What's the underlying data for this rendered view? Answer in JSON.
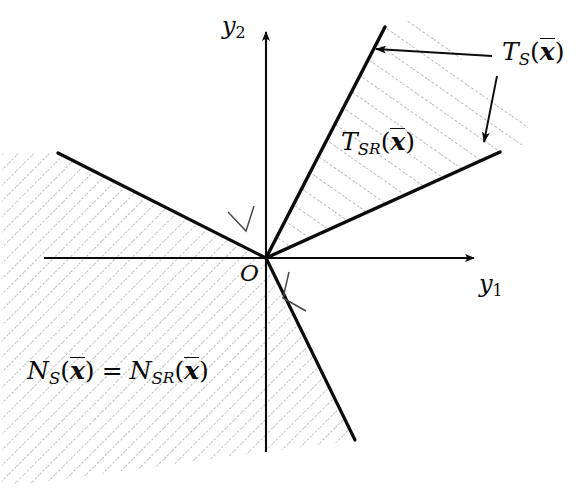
{
  "figure": {
    "background_color": "#ffffff",
    "ink_color": "#0b0b0b",
    "hatch_color": "#8a8a8a",
    "width": 580,
    "height": 489
  },
  "axes": {
    "origin_label": "O",
    "x_axis_label_base": "y",
    "x_axis_label_sub": "1",
    "y_axis_label_base": "y",
    "y_axis_label_sub": "2",
    "origin_px": [
      266,
      258
    ],
    "x_axis_tip_px": [
      478,
      258
    ],
    "y_axis_tip_px": [
      266,
      28
    ]
  },
  "labels": {
    "tangent_cone_S": {
      "base": "T",
      "subscript": "S",
      "argument": "x"
    },
    "tangent_cone_SR": {
      "base": "T",
      "subscript": "S",
      "subscript_sub": "R",
      "argument": "x"
    },
    "normal_cone_equation": {
      "left_base": "N",
      "left_subscript": "S",
      "left_argument": "x",
      "relation": "=",
      "right_base": "N",
      "right_subscript": "S",
      "right_subscript_sub": "R",
      "right_argument": "x"
    }
  },
  "regions": {
    "tangent_cone": {
      "name": "tangent-cone",
      "apex_px": [
        266,
        258
      ],
      "edge_upper_px": [
        385,
        27
      ],
      "edge_lower_px": [
        500,
        152
      ],
      "hatch_style": "dotted-diagonal",
      "hatch_angle_deg": -55
    },
    "normal_cone": {
      "name": "normal-cone",
      "apex_px": [
        266,
        258
      ],
      "edge_upper_px": [
        58,
        153
      ],
      "edge_lower_px": [
        355,
        440
      ],
      "hatch_style": "dotted-diagonal",
      "hatch_angle_deg": 45
    }
  },
  "annotations": {
    "arrow_to_upper_tangent_edge": {
      "from_px": [
        493,
        56
      ],
      "to_px": [
        372,
        49
      ]
    },
    "arrow_to_lower_tangent_edge": {
      "from_px": [
        497,
        78
      ],
      "to_px": [
        484,
        147
      ]
    }
  },
  "right_angle_marks": {
    "upper_left": {
      "vertex_px": [
        243,
        219
      ],
      "description": "perpendicular mark between normal cone upper edge and tangent cone upper edge"
    },
    "lower_right": {
      "vertex_px": [
        296,
        290
      ],
      "description": "perpendicular mark between normal cone lower edge and tangent cone lower edge"
    }
  }
}
